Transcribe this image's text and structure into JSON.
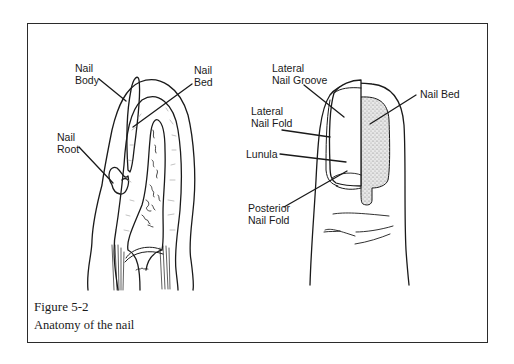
{
  "figure": {
    "number": "Figure 5-2",
    "caption": "Anatomy of the nail"
  },
  "cross_section": {
    "labels": [
      {
        "id": "nail-body",
        "line1": "Nail",
        "line2": "Body"
      },
      {
        "id": "nail-bed",
        "line1": "Nail",
        "line2": "Bed"
      },
      {
        "id": "nail-root",
        "line1": "Nail",
        "line2": "Root"
      }
    ]
  },
  "finger_view": {
    "labels": [
      {
        "id": "lateral-nail-groove",
        "line1": "Lateral",
        "line2": "Nail Groove"
      },
      {
        "id": "lateral-nail-fold",
        "line1": "Lateral",
        "line2": "Nail Fold"
      },
      {
        "id": "lunula",
        "line1": "Lunula"
      },
      {
        "id": "posterior-nail-fold",
        "line1": "Posterior",
        "line2": "Nail Fold"
      },
      {
        "id": "nail-bed-right",
        "line1": "Nail Bed"
      }
    ]
  },
  "colors": {
    "ink": "#1a1a1a",
    "border": "#2b2b2b",
    "stipple": "#9a9a9a",
    "background": "#ffffff"
  }
}
